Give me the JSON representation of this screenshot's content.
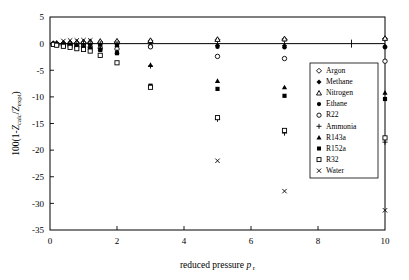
{
  "chart_data": {
    "type": "scatter",
    "title": "",
    "xlabel": "reduced pressure p r",
    "xlabel_main": "reduced pressure",
    "xlabel_symbol": "p",
    "xlabel_subscript": "r",
    "ylabel": "100(1-Zcalc/Zexpt)",
    "ylabel_prefix": "100(1-",
    "ylabel_z1": "Z",
    "ylabel_sub1": "calc",
    "ylabel_slash": "/",
    "ylabel_z2": "Z",
    "ylabel_sub2": "expt",
    "ylabel_suffix": ")",
    "xlim": [
      0,
      10
    ],
    "ylim": [
      -35,
      5
    ],
    "xticks": [
      0,
      2,
      4,
      6,
      8,
      10
    ],
    "xtick_labels": [
      "0",
      "2",
      "4",
      "6",
      "8",
      "10"
    ],
    "xminor_ticks": [
      1,
      3,
      5,
      7,
      9
    ],
    "yticks": [
      5,
      0,
      -5,
      -10,
      -15,
      -20,
      -25,
      -30,
      -35
    ],
    "ytick_labels": [
      "5",
      "0",
      "-5",
      "-10",
      "-15",
      "-20",
      "-25",
      "-30",
      "-35"
    ],
    "grid": false,
    "legend_position": "right-upper-inside",
    "series": [
      {
        "name": "Argon",
        "marker": "open-diamond",
        "points": [
          {
            "x": 0.1,
            "y": 0.0
          },
          {
            "x": 0.2,
            "y": 0.0
          },
          {
            "x": 0.4,
            "y": 0.05
          },
          {
            "x": 0.6,
            "y": 0.1
          },
          {
            "x": 0.8,
            "y": 0.15
          },
          {
            "x": 1.0,
            "y": 0.2
          },
          {
            "x": 1.2,
            "y": 0.25
          },
          {
            "x": 1.5,
            "y": 0.3
          },
          {
            "x": 2.0,
            "y": 0.35
          },
          {
            "x": 3.0,
            "y": 0.5
          },
          {
            "x": 5.0,
            "y": 0.7
          },
          {
            "x": 7.0,
            "y": 0.8
          },
          {
            "x": 10.0,
            "y": 0.9
          }
        ]
      },
      {
        "name": "Methane",
        "marker": "filled-diamond",
        "points": [
          {
            "x": 0.1,
            "y": 0.0
          },
          {
            "x": 0.2,
            "y": -0.05
          },
          {
            "x": 0.4,
            "y": -0.05
          },
          {
            "x": 0.6,
            "y": -0.1
          },
          {
            "x": 0.8,
            "y": -0.1
          },
          {
            "x": 1.0,
            "y": -0.15
          },
          {
            "x": 1.2,
            "y": -0.15
          },
          {
            "x": 1.5,
            "y": -0.2
          },
          {
            "x": 2.0,
            "y": -0.2
          },
          {
            "x": 3.0,
            "y": -0.3
          },
          {
            "x": 5.0,
            "y": -0.35
          },
          {
            "x": 7.0,
            "y": -0.4
          },
          {
            "x": 10.0,
            "y": -0.5
          }
        ]
      },
      {
        "name": "Nitrogen",
        "marker": "open-triangle",
        "points": [
          {
            "x": 0.1,
            "y": 0.05
          },
          {
            "x": 0.2,
            "y": 0.1
          },
          {
            "x": 0.4,
            "y": 0.15
          },
          {
            "x": 0.6,
            "y": 0.2
          },
          {
            "x": 0.8,
            "y": 0.3
          },
          {
            "x": 1.0,
            "y": 0.35
          },
          {
            "x": 1.2,
            "y": 0.4
          },
          {
            "x": 1.5,
            "y": 0.45
          },
          {
            "x": 2.0,
            "y": 0.5
          },
          {
            "x": 3.0,
            "y": 0.6
          },
          {
            "x": 5.0,
            "y": 0.8
          },
          {
            "x": 7.0,
            "y": 0.9
          },
          {
            "x": 10.0,
            "y": 1.0
          }
        ]
      },
      {
        "name": "Ethane",
        "marker": "filled-circle",
        "points": [
          {
            "x": 0.1,
            "y": -0.05
          },
          {
            "x": 0.2,
            "y": -0.1
          },
          {
            "x": 0.4,
            "y": -0.2
          },
          {
            "x": 0.6,
            "y": -0.25
          },
          {
            "x": 0.8,
            "y": -0.3
          },
          {
            "x": 1.0,
            "y": -0.35
          },
          {
            "x": 1.2,
            "y": -0.4
          },
          {
            "x": 1.5,
            "y": -0.45
          },
          {
            "x": 2.0,
            "y": -0.5
          },
          {
            "x": 3.0,
            "y": -0.55
          },
          {
            "x": 5.0,
            "y": -0.6
          },
          {
            "x": 7.0,
            "y": -0.7
          },
          {
            "x": 10.0,
            "y": -0.7
          }
        ]
      },
      {
        "name": "R22",
        "marker": "open-circle",
        "points": [
          {
            "x": 0.1,
            "y": -0.1
          },
          {
            "x": 0.2,
            "y": -0.2
          },
          {
            "x": 0.4,
            "y": -0.3
          },
          {
            "x": 0.6,
            "y": -0.4
          },
          {
            "x": 0.8,
            "y": -0.5
          },
          {
            "x": 1.0,
            "y": -0.6
          },
          {
            "x": 1.2,
            "y": -0.7
          },
          {
            "x": 1.5,
            "y": -0.85
          },
          {
            "x": 2.0,
            "y": -1.0
          },
          {
            "x": 3.0,
            "y": -0.6
          },
          {
            "x": 5.0,
            "y": -2.4
          },
          {
            "x": 7.0,
            "y": -2.8
          },
          {
            "x": 10.0,
            "y": -3.3
          }
        ]
      },
      {
        "name": "Ammonia",
        "marker": "plus",
        "points": [
          {
            "x": 0.1,
            "y": 0.0
          },
          {
            "x": 0.2,
            "y": 0.0
          },
          {
            "x": 0.4,
            "y": 0.0
          },
          {
            "x": 0.6,
            "y": 0.0
          },
          {
            "x": 0.8,
            "y": 0.0
          },
          {
            "x": 1.0,
            "y": 0.0
          },
          {
            "x": 1.2,
            "y": 0.0
          },
          {
            "x": 1.5,
            "y": 0.0
          },
          {
            "x": 2.0,
            "y": 0.0
          },
          {
            "x": 3.0,
            "y": -4.2
          },
          {
            "x": 5.0,
            "y": -14.2
          },
          {
            "x": 7.0,
            "y": -16.8
          },
          {
            "x": 10.0,
            "y": -18.5
          }
        ]
      },
      {
        "name": "R143a",
        "marker": "filled-triangle",
        "points": [
          {
            "x": 0.1,
            "y": -0.1
          },
          {
            "x": 0.2,
            "y": -0.15
          },
          {
            "x": 0.4,
            "y": -0.25
          },
          {
            "x": 0.6,
            "y": -0.35
          },
          {
            "x": 0.8,
            "y": -0.45
          },
          {
            "x": 1.0,
            "y": -0.55
          },
          {
            "x": 1.2,
            "y": -0.7
          },
          {
            "x": 1.5,
            "y": -0.9
          },
          {
            "x": 2.0,
            "y": -1.5
          },
          {
            "x": 3.0,
            "y": -4.0
          },
          {
            "x": 5.0,
            "y": -7.0
          },
          {
            "x": 7.0,
            "y": -8.2
          },
          {
            "x": 10.0,
            "y": -9.2
          }
        ]
      },
      {
        "name": "R152a",
        "marker": "filled-square",
        "points": [
          {
            "x": 0.1,
            "y": -0.1
          },
          {
            "x": 0.2,
            "y": -0.2
          },
          {
            "x": 0.4,
            "y": -0.3
          },
          {
            "x": 0.6,
            "y": -0.45
          },
          {
            "x": 0.8,
            "y": -0.6
          },
          {
            "x": 1.0,
            "y": -0.75
          },
          {
            "x": 1.2,
            "y": -0.9
          },
          {
            "x": 1.5,
            "y": -1.2
          },
          {
            "x": 2.0,
            "y": -1.8
          },
          {
            "x": 3.0,
            "y": -7.9
          },
          {
            "x": 5.0,
            "y": -8.5
          },
          {
            "x": 7.0,
            "y": -9.8
          },
          {
            "x": 10.0,
            "y": -10.4
          }
        ]
      },
      {
        "name": "R32",
        "marker": "open-square",
        "points": [
          {
            "x": 0.1,
            "y": -0.15
          },
          {
            "x": 0.2,
            "y": -0.3
          },
          {
            "x": 0.4,
            "y": -0.5
          },
          {
            "x": 0.6,
            "y": -0.7
          },
          {
            "x": 0.8,
            "y": -0.95
          },
          {
            "x": 1.0,
            "y": -1.1
          },
          {
            "x": 1.2,
            "y": -1.4
          },
          {
            "x": 1.5,
            "y": -2.2
          },
          {
            "x": 2.0,
            "y": -3.6
          },
          {
            "x": 3.0,
            "y": -8.2
          },
          {
            "x": 5.0,
            "y": -13.9
          },
          {
            "x": 7.0,
            "y": -16.3
          },
          {
            "x": 10.0,
            "y": -17.7
          }
        ]
      },
      {
        "name": "Water",
        "marker": "cross",
        "points": [
          {
            "x": 0.4,
            "y": 0.5
          },
          {
            "x": 0.6,
            "y": 0.6
          },
          {
            "x": 0.8,
            "y": 0.6
          },
          {
            "x": 1.0,
            "y": 0.65
          },
          {
            "x": 1.2,
            "y": 0.6
          },
          {
            "x": 5.0,
            "y": -22.0
          },
          {
            "x": 7.0,
            "y": -27.7
          },
          {
            "x": 10.0,
            "y": -31.3
          }
        ]
      }
    ]
  },
  "legend": {
    "entries": [
      {
        "label": "Argon",
        "marker": "open-diamond"
      },
      {
        "label": "Methane",
        "marker": "filled-diamond"
      },
      {
        "label": "Nitrogen",
        "marker": "open-triangle"
      },
      {
        "label": "Ethane",
        "marker": "filled-circle"
      },
      {
        "label": "R22",
        "marker": "open-circle"
      },
      {
        "label": "Ammonia",
        "marker": "plus"
      },
      {
        "label": "R143a",
        "marker": "filled-triangle"
      },
      {
        "label": "R152a",
        "marker": "filled-square"
      },
      {
        "label": "R32",
        "marker": "open-square"
      },
      {
        "label": "Water",
        "marker": "cross"
      }
    ]
  },
  "colors": {
    "axis": "#000000",
    "marker": "#000000",
    "background": "#ffffff"
  }
}
